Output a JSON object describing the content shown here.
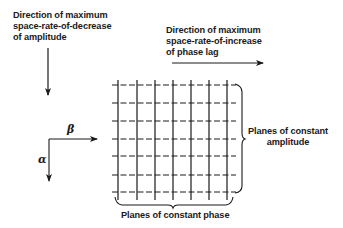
{
  "diagram": {
    "left_label": {
      "lines": [
        "Direction of maximum",
        "space-rate-of-decrease",
        "of amplitude"
      ]
    },
    "right_label": {
      "lines": [
        "Direction of maximum",
        "space-rate-of-increase",
        "of phase lag"
      ]
    },
    "axes": {
      "horizontal_symbol": "β",
      "vertical_symbol": "α"
    },
    "grid": {
      "vertical_lines": 7,
      "horizontal_dashed_lines": 7,
      "vertical_line_style": "solid",
      "horizontal_line_style": "dashed"
    },
    "brace_right_label": {
      "lines": [
        "Planes of constant",
        "amplitude"
      ]
    },
    "brace_bottom_label": "Planes of constant phase",
    "colors": {
      "ink": "#1a1a1a",
      "background": "#ffffff"
    }
  }
}
